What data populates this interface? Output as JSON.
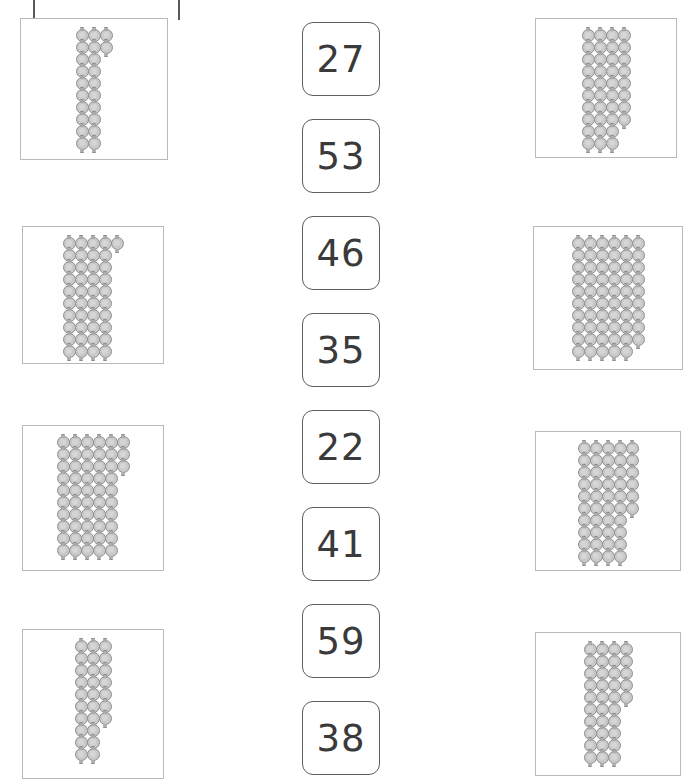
{
  "page": {
    "background": "#ffffff",
    "bead_color": "#c9c9c9",
    "bead_outline": "#8f8f8f",
    "box_border": "#b9b9b9",
    "card_border": "#5e5e5e",
    "card_text_color": "#3a3a3a"
  },
  "crop_marks": [
    {
      "name": "crop-tick-left",
      "x": 33,
      "y": 0
    },
    {
      "name": "crop-tick-right",
      "x": 178,
      "y": 0
    }
  ],
  "number_cards": [
    {
      "value": "27",
      "x": 302,
      "y": 22
    },
    {
      "value": "53",
      "x": 302,
      "y": 119
    },
    {
      "value": "46",
      "x": 302,
      "y": 216
    },
    {
      "value": "35",
      "x": 302,
      "y": 313
    },
    {
      "value": "22",
      "x": 302,
      "y": 410
    },
    {
      "value": "41",
      "x": 302,
      "y": 507
    },
    {
      "value": "59",
      "x": 302,
      "y": 604
    },
    {
      "value": "38",
      "x": 302,
      "y": 701
    }
  ],
  "left_boxes": [
    {
      "name": "bead-box-left-1",
      "total": 22,
      "tens": 2,
      "ones": 2,
      "x": 20,
      "y": 18,
      "w": 148,
      "h": 142
    },
    {
      "name": "bead-box-left-2",
      "total": 41,
      "tens": 4,
      "ones": 1,
      "x": 22,
      "y": 226,
      "w": 142,
      "h": 138
    },
    {
      "name": "bead-box-left-3",
      "total": 53,
      "tens": 5,
      "ones": 3,
      "x": 22,
      "y": 425,
      "w": 142,
      "h": 146
    },
    {
      "name": "bead-box-left-4",
      "total": 27,
      "tens": 2,
      "ones": 7,
      "x": 22,
      "y": 629,
      "w": 142,
      "h": 150
    }
  ],
  "right_boxes": [
    {
      "name": "bead-box-right-1",
      "total": 38,
      "tens": 3,
      "ones": 8,
      "x": 535,
      "y": 18,
      "w": 142,
      "h": 140
    },
    {
      "name": "bead-box-right-2",
      "total": 59,
      "tens": 5,
      "ones": 9,
      "x": 533,
      "y": 226,
      "w": 150,
      "h": 144
    },
    {
      "name": "bead-box-right-3",
      "total": 46,
      "tens": 4,
      "ones": 6,
      "x": 535,
      "y": 431,
      "w": 146,
      "h": 140
    },
    {
      "name": "bead-box-right-4",
      "total": 35,
      "tens": 3,
      "ones": 5,
      "x": 535,
      "y": 632,
      "w": 146,
      "h": 144
    }
  ],
  "chart_data": {
    "type": "table",
    "categories": [
      "left-1",
      "left-2",
      "left-3",
      "left-4",
      "right-1",
      "right-2",
      "right-3",
      "right-4"
    ],
    "values": [
      22,
      41,
      53,
      27,
      38,
      59,
      46,
      35
    ]
  }
}
